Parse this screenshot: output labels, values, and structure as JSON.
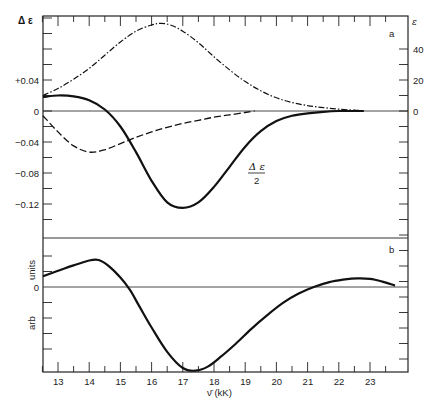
{
  "chart_data": [
    {
      "panel": "a",
      "type": "line",
      "panel_label": "a",
      "xlabel": "ν̄ (kK)",
      "xlim": [
        12.5,
        23.8
      ],
      "x_ticks": [
        13,
        14,
        15,
        16,
        17,
        18,
        19,
        20,
        21,
        22,
        23
      ],
      "left_axis": {
        "label": "Δε",
        "ticks": [
          "+0.04",
          "0",
          "-0.04",
          "-0.08",
          "-0.12"
        ],
        "tick_values": [
          0.04,
          0,
          -0.04,
          -0.08,
          -0.12
        ],
        "ylim": [
          -0.165,
          0.125
        ]
      },
      "right_axis": {
        "label": "ε",
        "ticks": [
          "40",
          "20",
          "0"
        ],
        "tick_values": [
          40,
          20,
          0
        ],
        "ylim": [
          -10,
          57
        ]
      },
      "series": [
        {
          "name": "ε (absorption)",
          "style": "dash-dot",
          "axis": "right",
          "x": [
            12.5,
            13.0,
            13.5,
            14.0,
            14.5,
            15.0,
            15.5,
            16.0,
            16.3,
            16.6,
            17.0,
            17.5,
            18.0,
            18.5,
            19.0,
            19.5,
            20.0,
            20.5,
            21.0,
            21.5,
            22.0,
            22.5,
            22.8
          ],
          "values": [
            10.0,
            14.5,
            20.5,
            27.5,
            36.0,
            44.5,
            51.5,
            55.5,
            56.5,
            55.5,
            51.5,
            44.0,
            35.0,
            26.5,
            19.0,
            13.0,
            8.5,
            5.5,
            3.5,
            2.2,
            1.2,
            0.5,
            0.2
          ]
        },
        {
          "name": "Δε/2 (MCD)",
          "style": "solid-bold",
          "axis": "left",
          "annotation": "Δε / 2",
          "x": [
            12.5,
            13.0,
            13.5,
            14.0,
            14.5,
            15.0,
            15.5,
            16.0,
            16.5,
            17.0,
            17.5,
            18.0,
            18.5,
            19.0,
            19.5,
            20.0,
            20.5,
            21.0,
            21.5,
            22.0,
            22.5,
            22.8
          ],
          "values": [
            0.018,
            0.02,
            0.019,
            0.014,
            0.002,
            -0.02,
            -0.053,
            -0.09,
            -0.118,
            -0.125,
            -0.118,
            -0.098,
            -0.072,
            -0.046,
            -0.026,
            -0.013,
            -0.006,
            -0.003,
            -0.001,
            0.0,
            0.0,
            0.0
          ]
        },
        {
          "name": "Δε (dashed)",
          "style": "dashed",
          "axis": "left",
          "x": [
            12.5,
            13.0,
            13.5,
            14.0,
            14.5,
            15.0,
            15.5,
            16.0,
            16.5,
            17.0,
            17.5,
            18.0,
            18.5,
            19.0,
            19.3
          ],
          "values": [
            -0.006,
            -0.027,
            -0.045,
            -0.053,
            -0.05,
            -0.042,
            -0.034,
            -0.027,
            -0.021,
            -0.016,
            -0.012,
            -0.008,
            -0.005,
            -0.002,
            0.0
          ]
        }
      ],
      "grid": false,
      "zero_line": true
    },
    {
      "panel": "b",
      "type": "line",
      "panel_label": "b",
      "xlabel": "ν̄ (kK)",
      "xlim": [
        12.5,
        23.8
      ],
      "x_ticks": [
        13,
        14,
        15,
        16,
        17,
        18,
        19,
        20,
        21,
        22,
        23
      ],
      "left_axis": {
        "label": "arb units",
        "ticks": [
          "0"
        ],
        "tick_values": [
          0
        ],
        "ylim": [
          -3.6,
          2.4
        ]
      },
      "series": [
        {
          "name": "calculated MCD",
          "style": "solid-bold",
          "x": [
            12.5,
            13.0,
            13.5,
            14.0,
            14.3,
            14.6,
            15.0,
            15.3,
            15.6,
            16.0,
            16.5,
            17.0,
            17.4,
            17.8,
            18.2,
            18.7,
            19.2,
            19.7,
            20.2,
            20.7,
            21.2,
            21.7,
            22.2,
            22.6,
            23.0,
            23.4,
            23.8
          ],
          "values": [
            0.4,
            0.6,
            0.8,
            0.98,
            1.0,
            0.8,
            0.35,
            -0.1,
            -0.7,
            -1.5,
            -2.4,
            -3.0,
            -3.1,
            -2.95,
            -2.6,
            -2.1,
            -1.55,
            -1.05,
            -0.6,
            -0.25,
            0.0,
            0.18,
            0.28,
            0.32,
            0.3,
            0.2,
            0.05
          ]
        }
      ],
      "grid": false,
      "zero_line": true
    }
  ],
  "labels": {
    "left_axis_title": "Δ ε",
    "right_axis_title": "ε",
    "panel_a": "a",
    "panel_b": "b",
    "panel_b_units_1": "arb",
    "panel_b_units_2": "units",
    "annotation_num": "Δ ε",
    "annotation_den": "2",
    "xlabel": "ν̄ (kK)",
    "left_ticks_a": [
      "+0.04",
      "0",
      "-0.04",
      "-0.08",
      "-0.12"
    ],
    "right_ticks_a": [
      "40",
      "20",
      "0"
    ],
    "left_ticks_b": [
      "0"
    ],
    "x_ticks": [
      "13",
      "14",
      "15",
      "16",
      "17",
      "18",
      "19",
      "20",
      "21",
      "22",
      "23"
    ]
  }
}
